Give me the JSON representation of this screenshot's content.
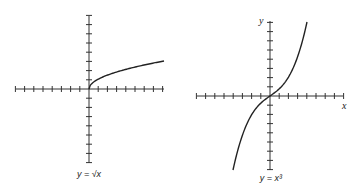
{
  "graphs": [
    {
      "id": "sqrt",
      "caption": "y = √x",
      "function": "sqrt",
      "axis_labels": {
        "x": "",
        "y": ""
      },
      "ticks_per_side": 8
    },
    {
      "id": "cube",
      "caption": "y = x³",
      "function": "cube",
      "axis_labels": {
        "x": "x",
        "y": "y"
      },
      "ticks_per_side": 8
    }
  ],
  "chart_data": [
    {
      "type": "line",
      "title": "y = √x",
      "xlabel": "",
      "ylabel": "",
      "xlim": [
        -8,
        8
      ],
      "ylim": [
        -8,
        8
      ],
      "grid": false,
      "series": [
        {
          "name": "y = √x",
          "x": [
            0,
            1,
            2,
            4,
            6,
            8
          ],
          "y": [
            0,
            1,
            1.41,
            2,
            2.45,
            2.83
          ]
        }
      ]
    },
    {
      "type": "line",
      "title": "y = x³",
      "xlabel": "x",
      "ylabel": "y",
      "xlim": [
        -8,
        8
      ],
      "ylim": [
        -8,
        8
      ],
      "grid": false,
      "series": [
        {
          "name": "y = x³",
          "x": [
            -2.1,
            -1.5,
            -1,
            0,
            1,
            1.5,
            2.1
          ],
          "y": [
            -9.3,
            -3.4,
            -1,
            0,
            1,
            3.4,
            9.3
          ]
        }
      ]
    }
  ]
}
